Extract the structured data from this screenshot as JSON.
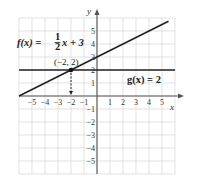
{
  "chart_data": {
    "type": "line",
    "title": "",
    "xlabel": "x",
    "ylabel": "y",
    "xlim": [
      -6,
      6
    ],
    "ylim": [
      -6,
      6
    ],
    "grid": true,
    "x_ticks": [
      -5,
      -4,
      -3,
      -2,
      -1,
      1,
      2,
      3,
      4,
      5
    ],
    "y_ticks": [
      -5,
      -4,
      -3,
      -2,
      -1,
      1,
      2,
      3,
      4,
      5
    ],
    "x_tick_labels": [
      "−5",
      "−4",
      "−3",
      "−2",
      "−1",
      "1",
      "2",
      "3",
      "4",
      "5"
    ],
    "y_tick_labels": [
      "−5",
      "−4",
      "−3",
      "−2",
      "−1",
      "1",
      "2",
      "3",
      "4",
      "5"
    ],
    "series": [
      {
        "name": "f(x) = 1/2 x + 3",
        "label_text": "f(x) = ½x + 3",
        "slope": 0.5,
        "intercept": 3,
        "x": [
          -6,
          5.5
        ],
        "y": [
          0,
          5.75
        ]
      },
      {
        "name": "g(x) = 2",
        "label_text": "g(x) = 2",
        "slope": 0,
        "intercept": 2,
        "x": [
          -6,
          6
        ],
        "y": [
          2,
          2
        ]
      }
    ],
    "annotations": [
      {
        "type": "point",
        "label": "(−2, 2)",
        "x": -2,
        "y": 2,
        "arrow_to_x_axis": true
      }
    ],
    "legend": "none (inline labels)"
  },
  "labels": {
    "x_axis": "x",
    "y_axis": "y",
    "f_prefix": "f(x) = ",
    "f_num": "1",
    "f_den": "2",
    "f_suffix": "x + 3",
    "g_label": "g(x) = 2",
    "point_label": "(−2, 2)"
  }
}
